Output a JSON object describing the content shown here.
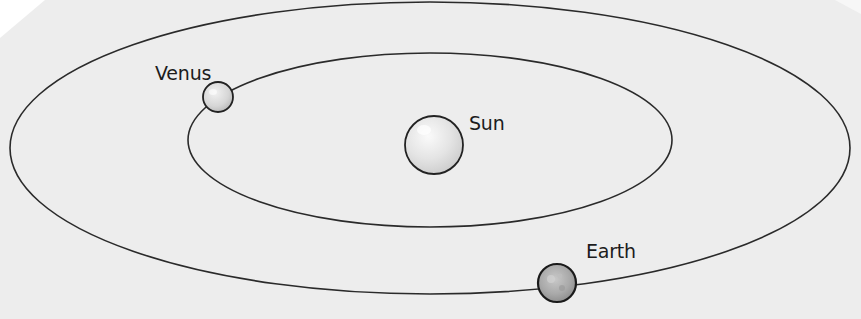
{
  "diagram": {
    "type": "orbital-diagram",
    "colors": {
      "paper": "#ededed",
      "corner": "#ffffff",
      "orbit_line": "#2a2a2a",
      "label_text": "#1c1c1c"
    },
    "orbits": [
      {
        "name": "outer-orbit",
        "body": "Earth",
        "cx": 430,
        "cy": 148,
        "rx": 420,
        "ry": 146
      },
      {
        "name": "inner-orbit",
        "body": "Venus",
        "cx": 430,
        "cy": 140,
        "rx": 242,
        "ry": 87
      }
    ],
    "bodies": [
      {
        "id": "sun",
        "label": "Sun",
        "cx": 434,
        "cy": 145,
        "r": 29,
        "label_x": 470,
        "label_y": 112
      },
      {
        "id": "venus",
        "label": "Venus",
        "cx": 218,
        "cy": 97,
        "r": 15,
        "label_x": 155,
        "label_y": 62
      },
      {
        "id": "earth",
        "label": "Earth",
        "cx": 557,
        "cy": 283,
        "r": 19,
        "label_x": 585,
        "label_y": 240
      }
    ]
  }
}
